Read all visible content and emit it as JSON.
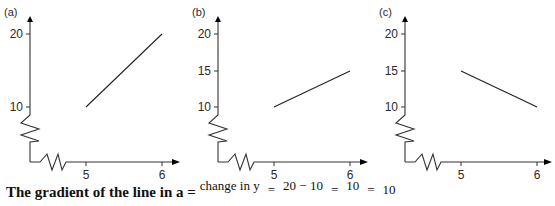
{
  "chart_data": [
    {
      "type": "line",
      "panel_label": "(a)",
      "x_ticks": [
        "5",
        "6"
      ],
      "y_ticks": [
        "10",
        "20"
      ],
      "x_axis_break": true,
      "y_axis_break": true,
      "series": [
        {
          "name": "line a",
          "x": [
            5,
            6
          ],
          "y": [
            10,
            20
          ]
        }
      ],
      "xlim": [
        4.4,
        6.2
      ],
      "ylim": [
        5,
        21.5
      ]
    },
    {
      "type": "line",
      "panel_label": "(b)",
      "x_ticks": [
        "5",
        "6"
      ],
      "y_ticks": [
        "10",
        "15",
        "20"
      ],
      "x_axis_break": true,
      "y_axis_break": true,
      "series": [
        {
          "name": "line b",
          "x": [
            5,
            6
          ],
          "y": [
            10,
            15
          ]
        }
      ],
      "xlim": [
        4.4,
        6.2
      ],
      "ylim": [
        5,
        21.5
      ]
    },
    {
      "type": "line",
      "panel_label": "(c)",
      "x_ticks": [
        "5",
        "6"
      ],
      "y_ticks": [
        "10",
        "15",
        "20"
      ],
      "x_axis_break": true,
      "y_axis_break": true,
      "series": [
        {
          "name": "line c",
          "x": [
            5,
            6
          ],
          "y": [
            15,
            10
          ]
        }
      ],
      "xlim": [
        4.4,
        6.2
      ],
      "ylim": [
        5,
        21.5
      ]
    }
  ],
  "caption": {
    "lead": "The gradient of the line in a =",
    "frac1_num": "change in y",
    "frac1_den": "",
    "eq1": "=",
    "frac2_num": "20 − 10",
    "frac2_den": "",
    "eq2": "=",
    "frac3_num": "10",
    "frac3_den": "",
    "eq3": "=",
    "result": "10"
  },
  "colors": {
    "axis": "#333333",
    "line": "#222222"
  }
}
